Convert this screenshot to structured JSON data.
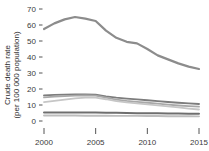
{
  "chart_data": {
    "type": "line",
    "title": "",
    "xlabel": "",
    "ylabel": "Crude death rate\n(per 100 000 population)",
    "ylabel_line1": "Crude death rate",
    "ylabel_line2": "(per 100 000 population)",
    "xlim": [
      2000,
      2015
    ],
    "ylim": [
      0,
      70
    ],
    "grid": false,
    "legend": "none",
    "yticks": [
      0,
      10,
      20,
      30,
      40,
      50,
      60,
      70
    ],
    "ytick_labels": [
      "0",
      "10",
      "20",
      "30",
      "40",
      "50",
      "60",
      "70"
    ],
    "xticks": [
      2000,
      2005,
      2010,
      2015
    ],
    "xtick_labels": [
      "2000",
      "2005",
      "2010",
      "2015"
    ],
    "x": [
      2000,
      2001,
      2002,
      2003,
      2004,
      2005,
      2006,
      2007,
      2008,
      2009,
      2010,
      2011,
      2012,
      2013,
      2014,
      2015
    ],
    "series": [
      {
        "name": "series-1",
        "color": "#8c8c8c",
        "width": 2.2,
        "values": [
          57.5,
          61.0,
          63.5,
          65.0,
          64.0,
          62.5,
          56.5,
          52.0,
          49.5,
          48.5,
          45.0,
          41.0,
          38.5,
          36.0,
          34.0,
          32.5
        ]
      },
      {
        "name": "series-2",
        "color": "#7d7d7d",
        "width": 1.9,
        "values": [
          16.0,
          16.3,
          16.5,
          16.6,
          16.6,
          16.4,
          15.4,
          14.6,
          14.0,
          13.5,
          13.0,
          12.4,
          11.9,
          11.4,
          11.0,
          10.6
        ]
      },
      {
        "name": "series-3",
        "color": "#a8a8a8",
        "width": 1.8,
        "values": [
          14.8,
          15.2,
          15.6,
          15.9,
          16.0,
          15.8,
          14.6,
          13.4,
          12.6,
          12.0,
          11.4,
          10.8,
          10.2,
          9.7,
          9.3,
          9.0
        ]
      },
      {
        "name": "series-4",
        "color": "#c6c6c6",
        "width": 1.8,
        "values": [
          11.8,
          12.6,
          13.4,
          14.2,
          14.6,
          14.6,
          13.6,
          12.4,
          11.6,
          11.0,
          10.4,
          9.8,
          9.2,
          8.5,
          7.8,
          7.2
        ]
      },
      {
        "name": "series-5",
        "color": "#6e6e6e",
        "width": 2.0,
        "values": [
          5.3,
          5.3,
          5.3,
          5.3,
          5.3,
          5.3,
          5.2,
          5.1,
          5.0,
          4.9,
          4.8,
          4.8,
          4.7,
          4.7,
          4.6,
          4.6
        ]
      },
      {
        "name": "series-6",
        "color": "#bdbdbd",
        "width": 1.9,
        "values": [
          3.4,
          3.4,
          3.4,
          3.4,
          3.3,
          3.3,
          3.3,
          3.2,
          3.2,
          3.2,
          3.1,
          3.1,
          3.0,
          3.0,
          3.0,
          2.9
        ]
      }
    ]
  }
}
